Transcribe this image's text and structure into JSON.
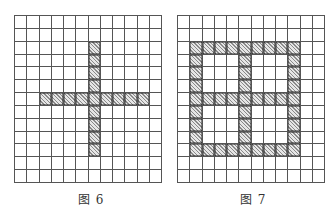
{
  "figures": [
    {
      "id": "fig6",
      "caption": "图 6",
      "rows": 13,
      "cols": 12,
      "shape": "cross",
      "shaded_cells": [
        [
          2,
          6
        ],
        [
          3,
          6
        ],
        [
          4,
          6
        ],
        [
          5,
          6
        ],
        [
          6,
          6
        ],
        [
          7,
          6
        ],
        [
          8,
          6
        ],
        [
          9,
          6
        ],
        [
          10,
          6
        ],
        [
          6,
          2
        ],
        [
          6,
          3
        ],
        [
          6,
          4
        ],
        [
          6,
          5
        ],
        [
          6,
          7
        ],
        [
          6,
          8
        ],
        [
          6,
          9
        ],
        [
          6,
          10
        ]
      ]
    },
    {
      "id": "fig7",
      "caption": "图 7",
      "rows": 13,
      "cols": 12,
      "shape": "window-frame",
      "shaded_cells": [
        [
          2,
          1
        ],
        [
          2,
          2
        ],
        [
          2,
          3
        ],
        [
          2,
          4
        ],
        [
          2,
          5
        ],
        [
          2,
          6
        ],
        [
          2,
          7
        ],
        [
          2,
          8
        ],
        [
          2,
          9
        ],
        [
          6,
          1
        ],
        [
          6,
          2
        ],
        [
          6,
          3
        ],
        [
          6,
          4
        ],
        [
          6,
          5
        ],
        [
          6,
          6
        ],
        [
          6,
          7
        ],
        [
          6,
          8
        ],
        [
          6,
          9
        ],
        [
          10,
          1
        ],
        [
          10,
          2
        ],
        [
          10,
          3
        ],
        [
          10,
          4
        ],
        [
          10,
          5
        ],
        [
          10,
          6
        ],
        [
          10,
          7
        ],
        [
          10,
          8
        ],
        [
          10,
          9
        ],
        [
          3,
          1
        ],
        [
          4,
          1
        ],
        [
          5,
          1
        ],
        [
          7,
          1
        ],
        [
          8,
          1
        ],
        [
          9,
          1
        ],
        [
          3,
          5
        ],
        [
          4,
          5
        ],
        [
          5,
          5
        ],
        [
          7,
          5
        ],
        [
          8,
          5
        ],
        [
          9,
          5
        ],
        [
          3,
          9
        ],
        [
          4,
          9
        ],
        [
          5,
          9
        ],
        [
          7,
          9
        ],
        [
          8,
          9
        ],
        [
          9,
          9
        ]
      ]
    }
  ],
  "colors": {
    "grid_line": "#555555",
    "hatch_dark": "#8a8a8a",
    "hatch_light": "#e6e6e6",
    "caption": "#333333"
  }
}
